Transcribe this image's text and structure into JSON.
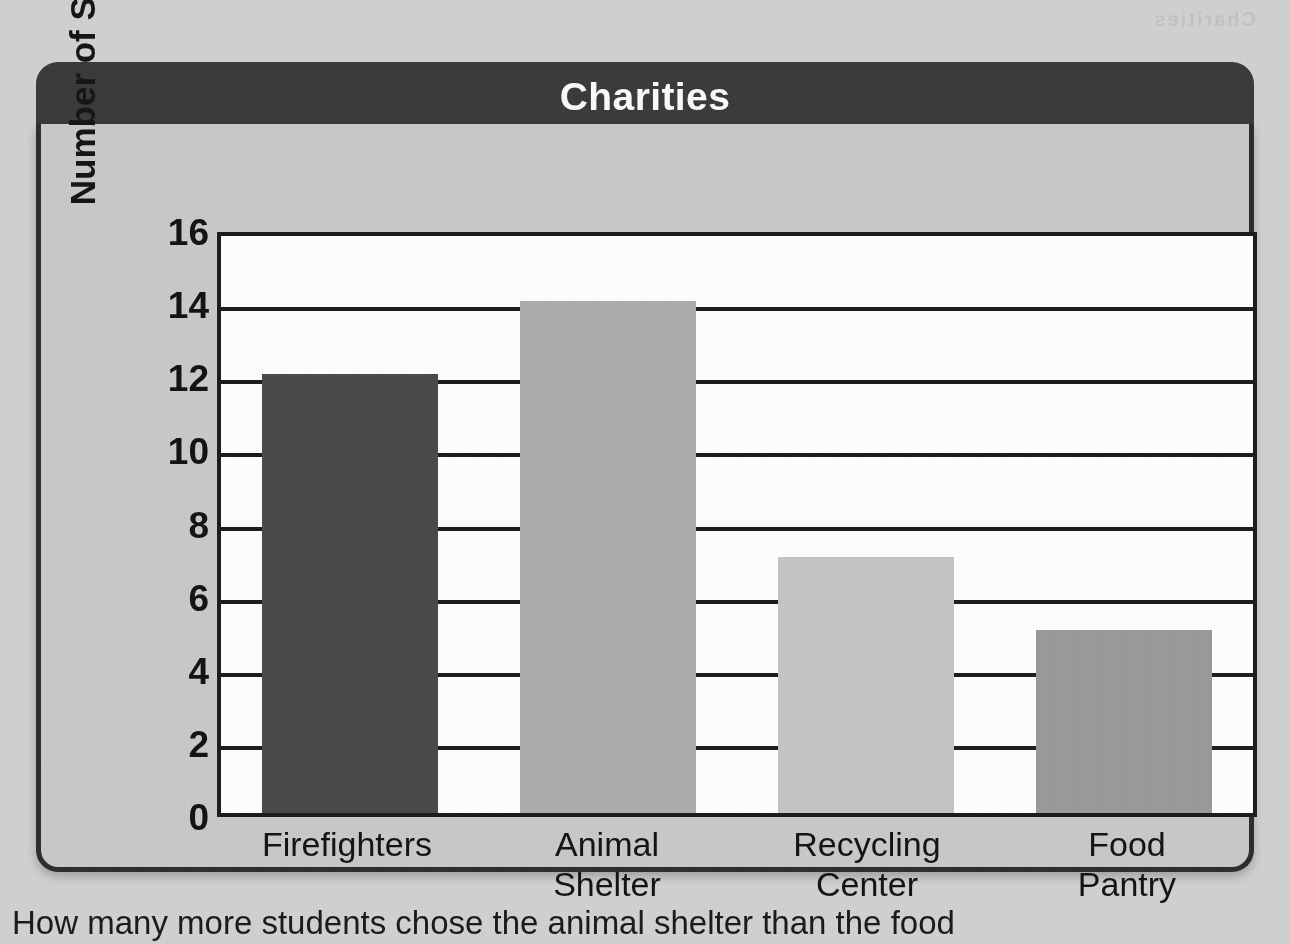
{
  "chart_data": {
    "type": "bar",
    "title": "Charities",
    "xlabel": "",
    "ylabel": "Number of Students",
    "categories": [
      "Firefighters",
      "Animal Shelter",
      "Recycling Center",
      "Food Pantry"
    ],
    "category_lines": [
      {
        "line1": "Firefighters",
        "line2": ""
      },
      {
        "line1": "Animal",
        "line2": "Shelter"
      },
      {
        "line1": "Recycling",
        "line2": "Center"
      },
      {
        "line1": "Food",
        "line2": "Pantry"
      }
    ],
    "values": [
      12,
      14,
      7,
      5
    ],
    "bar_colors": [
      "#4b4b4b",
      "#aeaeae",
      "#c6c6c6",
      "#9b9b9b"
    ],
    "ylim": [
      0,
      16
    ],
    "ytick_step": 2,
    "yticks": [
      16,
      14,
      12,
      10,
      8,
      6,
      4,
      2,
      0
    ],
    "grid": true,
    "legend": false,
    "legend_position": "none"
  },
  "card": {
    "title": "Charities",
    "header_color": "#3b3b3b",
    "body_color": "#cacaca",
    "border_color": "#2e2e2e",
    "plot_background": "#ffffff"
  },
  "page": {
    "background_color": "#d2d2d2",
    "caption_partial": "How many more students chose the animal shelter than the food",
    "bleed_text": "Charities"
  }
}
